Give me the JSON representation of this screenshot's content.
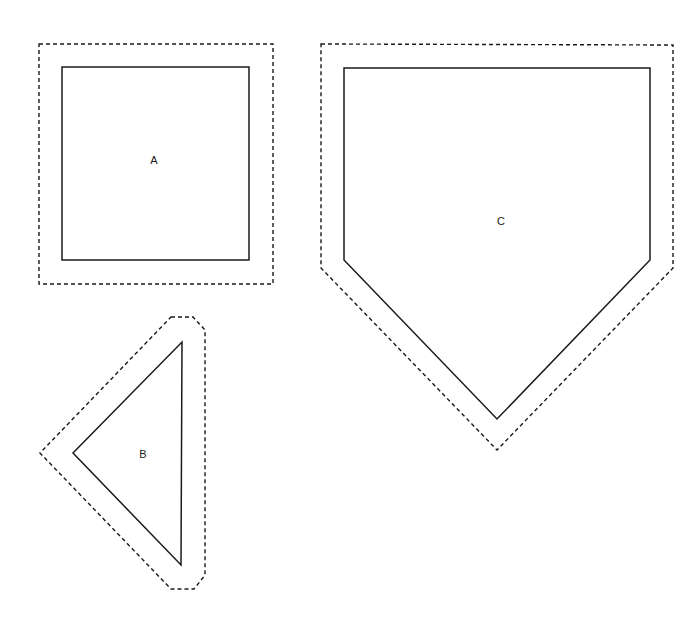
{
  "diagram": {
    "shapes": [
      {
        "id": "A",
        "label": "A",
        "type": "square",
        "outline_points": "62,67 249,67 249,260 62,260",
        "offset_points": "39,44 273,44 273,284 39,284",
        "label_x": 154,
        "label_y": 164
      },
      {
        "id": "B",
        "label": "B",
        "type": "triangle",
        "outline_points": "182,342 181,565 73,453",
        "offset_points": "171,317 193,317 205,330 205,575 194,589 171,589 40,453",
        "label_x": 143,
        "label_y": 458
      },
      {
        "id": "C",
        "label": "C",
        "type": "pentagon",
        "outline_points": "344,68 650,68 650,260 497,419 344,260",
        "offset_points": "321,44 673,45 673,268 497,450 321,268",
        "label_x": 501,
        "label_y": 225
      }
    ],
    "legend": {
      "solid_line": "shape outline",
      "dashed_line": "offset boundary"
    },
    "colors": {
      "stroke": "#1a1a1a",
      "background": "#ffffff"
    }
  }
}
